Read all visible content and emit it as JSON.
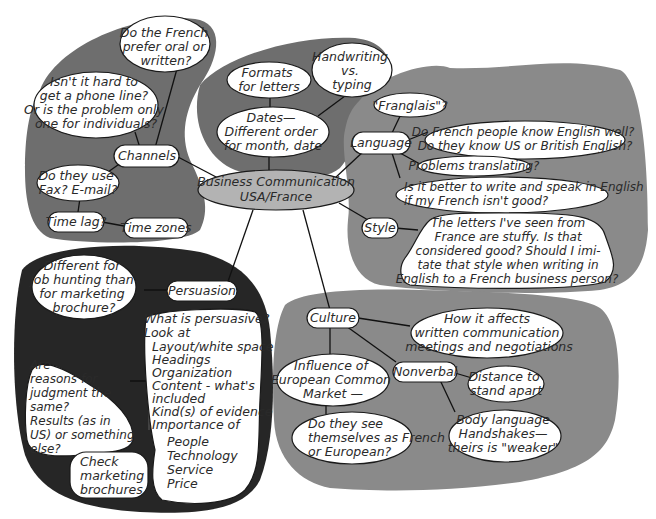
{
  "center": {
    "line1": "Business Communication",
    "line2": "USA/France"
  },
  "channels": {
    "label": "Channels",
    "oral_written": [
      "Do the French",
      "prefer oral or",
      "written?"
    ],
    "phone": [
      "Isn't it hard to",
      "get a phone line?",
      "Or is the problem only",
      "one for individuals?"
    ],
    "fax": [
      "Do they use",
      "Fax? E-mail?"
    ],
    "time_lag": "Time lag?",
    "time_zones": "Time zones"
  },
  "formats": {
    "formats": [
      "Formats",
      "for letters"
    ],
    "handwriting": [
      "Handwriting",
      "vs.",
      "typing"
    ],
    "dates": [
      "Dates—",
      "Different order",
      "for month, date"
    ]
  },
  "language": {
    "label": "Language",
    "franglais": "\"Franglais\"?",
    "know_english": [
      "Do French people know English well?",
      "Do they know US or British English?"
    ],
    "translating": "Problems translating?",
    "better": [
      "Is it better to write and speak in English",
      "if my French isn't good?"
    ]
  },
  "style": {
    "label": "Style",
    "letters": [
      "The letters I've seen from",
      "France are stuffy. Is that",
      "considered good? Should I imi-",
      "tate that style when writing in",
      "English to a French business person?"
    ]
  },
  "persuasion": {
    "label": "Persuasion",
    "different": [
      "Different for",
      "job hunting than",
      "for marketing",
      "brochure?"
    ],
    "what": [
      "What is persuasive?",
      "Look at"
    ],
    "look_items": [
      "Layout/white space",
      "Headings",
      "Organization",
      "Content - what's",
      "included",
      "Kind(s) of evidence",
      "Importance of"
    ],
    "importance_items": [
      "People",
      "Technology",
      "Service",
      "Price"
    ],
    "reasons": [
      "Are",
      "reasons for",
      "judgment the",
      "same?",
      "Results (as in",
      "US) or something",
      "else?"
    ],
    "check": [
      "Check",
      "marketing",
      "brochures"
    ]
  },
  "culture": {
    "label": "Culture",
    "affects": [
      "How it affects",
      "written communication",
      "meetings and negotiations"
    ],
    "influence": [
      "Influence of",
      "European Common",
      "Market —"
    ],
    "see_themselves": [
      "Do they see",
      "themselves as French",
      "or European?"
    ],
    "nonverbal": "Nonverbal",
    "distance": [
      "Distance to",
      "stand apart"
    ],
    "body": [
      "Body language",
      "Handshakes—",
      "theirs is \"weaker\""
    ]
  }
}
